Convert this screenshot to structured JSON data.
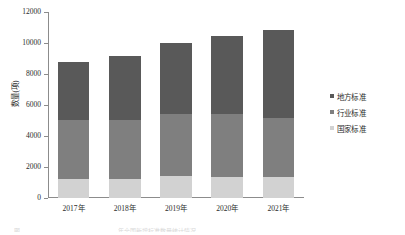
{
  "chart_data": {
    "type": "bar",
    "stacked": true,
    "title": "",
    "xlabel": "",
    "ylabel": "数量(项)",
    "categories": [
      "2017年",
      "2018年",
      "2019年",
      "2020年",
      "2021年"
    ],
    "series": [
      {
        "name": "国家标准",
        "color": "#d2d2d2",
        "values": [
          1200,
          1250,
          1400,
          1350,
          1350
        ]
      },
      {
        "name": "行业标准",
        "color": "#7f7f7f",
        "values": [
          3850,
          3800,
          4000,
          4050,
          3800
        ]
      },
      {
        "name": "地方标准",
        "color": "#595959",
        "values": [
          3750,
          4100,
          4600,
          5050,
          5700
        ]
      }
    ],
    "totals": [
      8800,
      9150,
      10000,
      10450,
      10850
    ],
    "ylim": [
      0,
      12000
    ],
    "yticks": [
      0,
      2000,
      4000,
      6000,
      8000,
      10000,
      12000
    ],
    "ytick_labels": [
      "0",
      "2000",
      "4000",
      "6000",
      "8000",
      "10000",
      "12000"
    ],
    "grid": false,
    "legend_position": "right",
    "legend_order_top_to_bottom": [
      "地方标准",
      "行业标准",
      "国家标准"
    ]
  },
  "axis": {
    "y_title": "数量(项)",
    "tick_labels": [
      "12000",
      "10000",
      "8000",
      "6000",
      "4000",
      "2000",
      "0"
    ]
  },
  "legend": {
    "items": [
      {
        "label": "地方标准",
        "color": "#595959"
      },
      {
        "label": "行业标准",
        "color": "#7f7f7f"
      },
      {
        "label": "国家标准",
        "color": "#d2d2d2"
      }
    ]
  },
  "caption_remnants": {
    "left": "图",
    "right": "年全国新增标准数量统计情况"
  }
}
